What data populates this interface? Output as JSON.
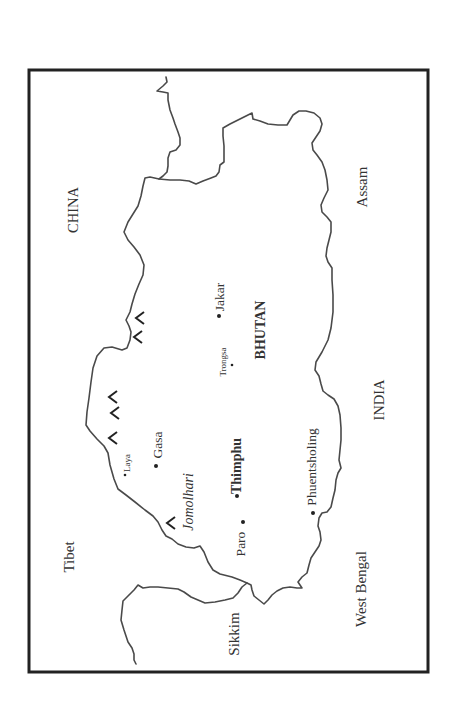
{
  "map": {
    "title": "Map of Bhutan",
    "country_label": "BHUTAN",
    "regions": [
      {
        "id": "china",
        "label": "CHINA",
        "style": "country"
      },
      {
        "id": "tibet",
        "label": "Tibet",
        "style": "region"
      },
      {
        "id": "assam",
        "label": "Assam",
        "style": "region"
      },
      {
        "id": "india",
        "label": "INDIA",
        "style": "country"
      },
      {
        "id": "west-bengal",
        "label": "West Bengal",
        "style": "region"
      },
      {
        "id": "sikkim",
        "label": "Sikkim",
        "style": "region"
      }
    ],
    "places": [
      {
        "id": "laya",
        "label": "Laya",
        "type": "town",
        "style": "small"
      },
      {
        "id": "gasa",
        "label": "Gasa",
        "type": "town",
        "style": "normal"
      },
      {
        "id": "thimphu",
        "label": "Thimphu",
        "type": "capital",
        "style": "bold"
      },
      {
        "id": "paro",
        "label": "Paro",
        "type": "town",
        "style": "normal"
      },
      {
        "id": "phuentsholing",
        "label": "Phuentsholing",
        "type": "town",
        "style": "normal"
      },
      {
        "id": "trongsa",
        "label": "Trongsa",
        "type": "town",
        "style": "small"
      },
      {
        "id": "jakar",
        "label": "Jakar",
        "type": "town",
        "style": "normal"
      }
    ],
    "features": [
      {
        "id": "jomolhari",
        "label": "Jomolhari",
        "type": "mountain",
        "style": "italic"
      }
    ],
    "mountain_symbol_count": 7,
    "colors": {
      "frame": "#222222",
      "border": "#4a4a4a",
      "text": "#333333"
    }
  }
}
